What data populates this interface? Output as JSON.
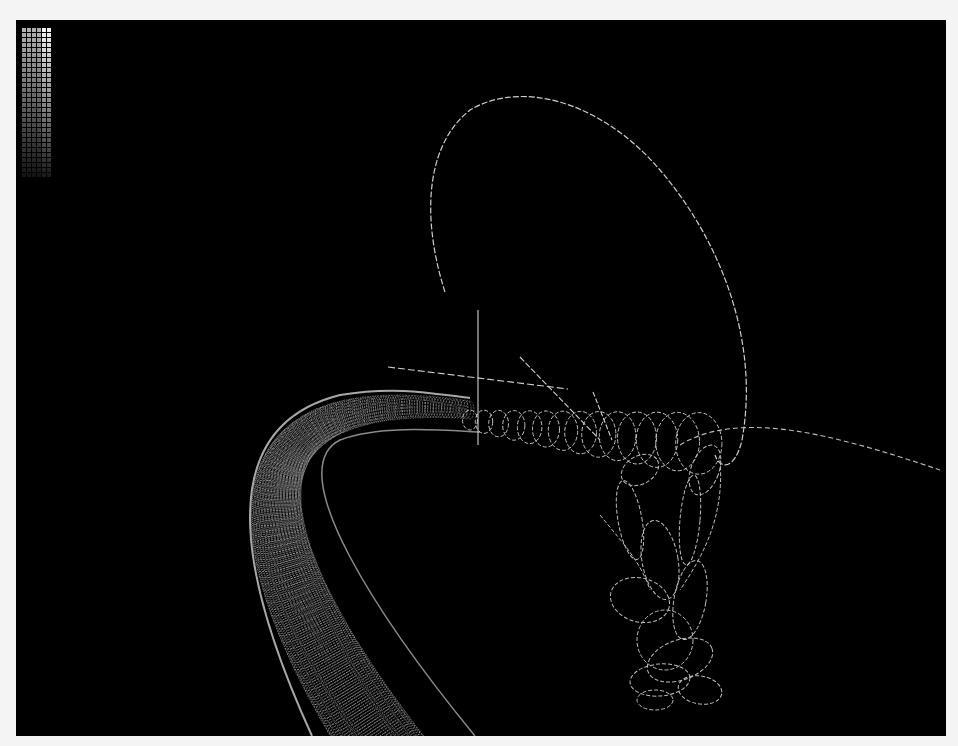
{
  "viewer": {
    "background": "#000000",
    "frame_background": "#f4f4f4",
    "line_color": "#d8d8d8",
    "tube_color": "#9a9a9a"
  },
  "palette": {
    "columns": 6,
    "rows": 30
  },
  "scene": {
    "objects": [
      "helical-tube",
      "helix-coils",
      "large-loop",
      "tangled-loops",
      "axes"
    ]
  }
}
